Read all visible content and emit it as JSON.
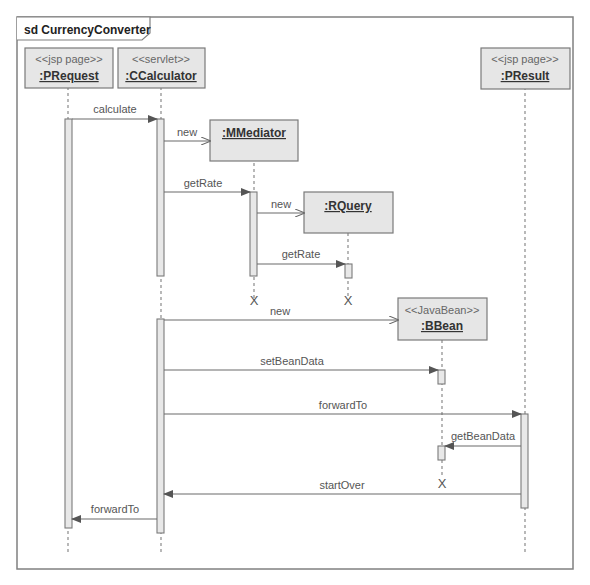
{
  "diagram": {
    "frame_title": "sd CurrencyConverter",
    "lifelines": [
      {
        "id": "prequest",
        "stereotype": "<<jsp page>>",
        "name": ":PRequest"
      },
      {
        "id": "ccalculator",
        "stereotype": "<<servlet>>",
        "name": ":CCalculator"
      },
      {
        "id": "mmediator",
        "stereotype": "",
        "name": ":MMediator"
      },
      {
        "id": "rquery",
        "stereotype": "",
        "name": ":RQuery"
      },
      {
        "id": "bbean",
        "stereotype": "<<JavaBean>>",
        "name": ":BBean"
      },
      {
        "id": "presult",
        "stereotype": "<<jsp page>>",
        "name": ":PResult"
      }
    ],
    "messages": [
      {
        "label": "calculate",
        "from": "prequest",
        "to": "ccalculator"
      },
      {
        "label": "new",
        "from": "ccalculator",
        "to": "mmediator",
        "kind": "create"
      },
      {
        "label": "getRate",
        "from": "ccalculator",
        "to": "mmediator"
      },
      {
        "label": "new",
        "from": "mmediator",
        "to": "rquery",
        "kind": "create"
      },
      {
        "label": "getRate",
        "from": "mmediator",
        "to": "rquery"
      },
      {
        "label": "new",
        "from": "ccalculator",
        "to": "bbean",
        "kind": "create"
      },
      {
        "label": "setBeanData",
        "from": "ccalculator",
        "to": "bbean"
      },
      {
        "label": "forwardTo",
        "from": "ccalculator",
        "to": "presult"
      },
      {
        "label": "getBeanData",
        "from": "presult",
        "to": "bbean"
      },
      {
        "label": "startOver",
        "from": "presult",
        "to": "ccalculator"
      },
      {
        "label": "forwardTo",
        "from": "ccalculator",
        "to": "prequest"
      }
    ],
    "destroy_mark": "X"
  }
}
